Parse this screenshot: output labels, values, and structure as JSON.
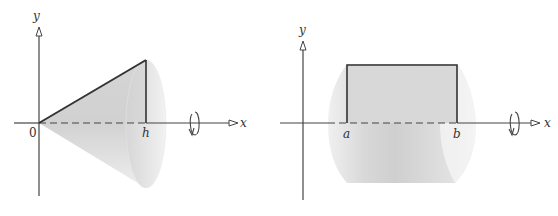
{
  "figures": [
    {
      "id": "cone",
      "description": "Right triangle with vertices at origin, (h,0) and (h,r) revolved about the x-axis forming a cone",
      "labels": {
        "y_axis": "y",
        "x_axis": "x",
        "origin": "0",
        "h": "h"
      },
      "colors": {
        "solid": "#d9d9d9",
        "edge": "#333333",
        "axis": "#444444"
      }
    },
    {
      "id": "cylinder",
      "description": "Rectangle from x=a to x=b revolved about the x-axis forming a cylinder",
      "labels": {
        "y_axis": "y",
        "x_axis": "x",
        "a": "a",
        "b": "b"
      },
      "colors": {
        "solid": "#d9d9d9",
        "edge": "#333333",
        "axis": "#444444"
      }
    }
  ]
}
